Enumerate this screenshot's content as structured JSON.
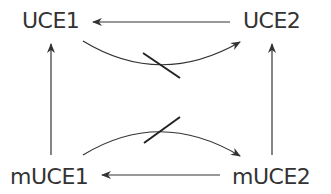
{
  "diagram": {
    "nodes": [
      {
        "id": "uce1",
        "label": "UCE1"
      },
      {
        "id": "uce2",
        "label": "UCE2"
      },
      {
        "id": "muce1",
        "label": "mUCE1"
      },
      {
        "id": "muce2",
        "label": "mUCE2"
      }
    ],
    "edges": [
      {
        "from": "uce2",
        "to": "uce1",
        "type": "straight-arrow",
        "blocked": false
      },
      {
        "from": "uce1",
        "to": "uce2",
        "type": "curved-arrow",
        "blocked": true
      },
      {
        "from": "muce1",
        "to": "uce1",
        "type": "straight-arrow",
        "blocked": false
      },
      {
        "from": "muce2",
        "to": "uce2",
        "type": "straight-arrow",
        "blocked": false
      },
      {
        "from": "muce1",
        "to": "muce2",
        "type": "curved-arrow",
        "blocked": true
      },
      {
        "from": "muce2",
        "to": "muce1",
        "type": "straight-arrow",
        "blocked": false
      }
    ],
    "colors": {
      "stroke": "#333333",
      "text": "#333333",
      "background": "#ffffff"
    }
  }
}
